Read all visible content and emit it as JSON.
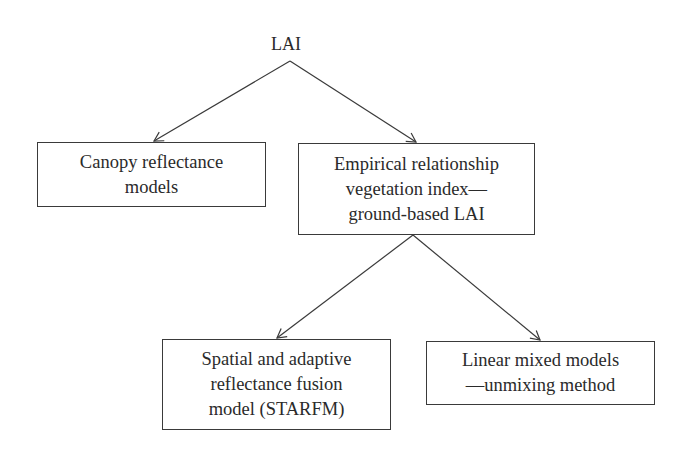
{
  "diagram": {
    "root": {
      "label": "LAI"
    },
    "nodes": [
      {
        "id": "canopy",
        "label": "Canopy reflectance\nmodels"
      },
      {
        "id": "empirical",
        "label": "Empirical relationship\nvegetation index—\nground-based LAI"
      },
      {
        "id": "starfm",
        "label": "Spatial and adaptive\nreflectance fusion\nmodel (STARFM)"
      },
      {
        "id": "linear",
        "label": "Linear mixed models\n—unmixing method"
      }
    ],
    "edges": [
      {
        "from": "LAI",
        "to": "canopy"
      },
      {
        "from": "LAI",
        "to": "empirical"
      },
      {
        "from": "empirical",
        "to": "starfm"
      },
      {
        "from": "empirical",
        "to": "linear"
      }
    ]
  }
}
